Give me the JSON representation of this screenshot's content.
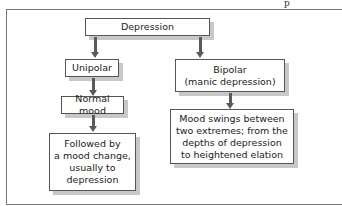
{
  "page": {
    "corner_mark": "p"
  },
  "diagram": {
    "root": {
      "label": "Depression"
    },
    "left_branch": {
      "type": {
        "label": "Unipolar"
      },
      "step1": {
        "label": "Normal mood"
      },
      "step2": {
        "label": "Followed by\na mood change,\nusually to\ndepression"
      }
    },
    "right_branch": {
      "type": {
        "label": "Bipolar\n(manic depression)"
      },
      "step1": {
        "label": "Mood swings between\ntwo extremes; from the\ndepths of depression\nto heightened elation"
      }
    },
    "colors": {
      "border": "#555555",
      "shadow": "#c8c8c8",
      "arrow": "#5a5a5a"
    }
  }
}
